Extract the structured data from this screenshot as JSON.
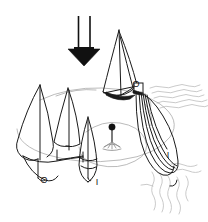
{
  "figure": {
    "background_color": "#ffffff",
    "ink_color": "#1a1a1a",
    "faint_ink_color": "#b9b9b9",
    "mid_ink_color": "#7d7d7d",
    "width": 208,
    "height": 222
  },
  "arrow": {
    "name": "wind-direction-arrow",
    "direction": "down",
    "color": "#111111",
    "shaft_left_x": 78,
    "shaft_right_x": 90,
    "shaft_top_y": 16,
    "shaft_bottom_y": 49,
    "head_tip_y": 66
  },
  "labels": [
    {
      "id": "label-o-top-right",
      "text": "O",
      "x": 136,
      "y": 85
    },
    {
      "id": "label-o-bottom-left",
      "text": "O",
      "x": 44,
      "y": 181
    },
    {
      "id": "label-i-middle",
      "text": "I",
      "x": 97,
      "y": 183
    },
    {
      "id": "label-i-right",
      "text": "I",
      "x": 168,
      "y": 156
    }
  ],
  "objects": {
    "boat_top_right": {
      "name": "sailboat-top-right",
      "description": "sailboat with mainsail and jib, dark hull"
    },
    "boat_left": {
      "name": "sailboat-left",
      "description": "large sailboat, two sails, left of frame"
    },
    "boat_middle": {
      "name": "sailboat-middle",
      "description": "narrow sail shape in middle-lower area"
    },
    "boat_right_trailing": {
      "name": "sailboat-right-trailing",
      "description": "elongated multi-line sail form trailing to lower right"
    },
    "buoy_mark": {
      "name": "course-mark-buoy",
      "description": "small buoy with ball on top and fan base, center of course"
    },
    "course_ellipse": {
      "name": "course-ellipse-guide",
      "description": "faint dashed elliptical course guide lines"
    },
    "water": {
      "name": "water-wake-lines",
      "description": "faint wavy lines indicating water and wake at right"
    }
  }
}
